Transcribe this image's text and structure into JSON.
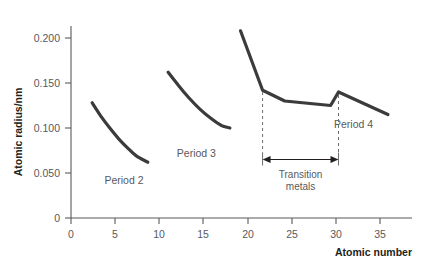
{
  "chart_data": {
    "type": "line",
    "title": "",
    "xlabel": "Atomic number",
    "ylabel": "Atomic radius/nm",
    "xlim": [
      0,
      38
    ],
    "ylim": [
      0,
      0.215
    ],
    "grid": false,
    "legend_position": "inline-labels",
    "x_ticks": [
      "0",
      "5",
      "10",
      "15",
      "20",
      "25",
      "30",
      "35"
    ],
    "x_tick_values": [
      0,
      5,
      10,
      15,
      20,
      25,
      30,
      35
    ],
    "y_ticks": [
      "0",
      "0.050",
      "0.100",
      "0.150",
      "0.200"
    ],
    "y_tick_values": [
      0,
      0.05,
      0.1,
      0.15,
      0.2
    ],
    "series": [
      {
        "name": "Period 2",
        "label": "Period 2",
        "label_x": 6.0,
        "label_y": 0.038,
        "curve": "smooth",
        "x": [
          2.4,
          3.4,
          4.4,
          5.4,
          6.4,
          7.4,
          8.7
        ],
        "values": [
          0.128,
          0.113,
          0.1,
          0.088,
          0.078,
          0.069,
          0.062
        ]
      },
      {
        "name": "Period 3",
        "label": "Period 3",
        "label_x": 14.2,
        "label_y": 0.068,
        "curve": "smooth",
        "x": [
          11.0,
          12.2,
          13.4,
          14.6,
          15.8,
          17.0,
          18.0
        ],
        "values": [
          0.162,
          0.147,
          0.133,
          0.121,
          0.111,
          0.103,
          0.1
        ]
      },
      {
        "name": "Period 4",
        "label": "Period 4",
        "label_x": 32.0,
        "label_y": 0.1,
        "curve": "linear",
        "x": [
          19.2,
          21.7,
          24.2,
          29.4,
          30.3,
          35.9
        ],
        "values": [
          0.208,
          0.142,
          0.13,
          0.125,
          0.14,
          0.115
        ]
      }
    ],
    "annotations": [
      {
        "name": "transition-metals-span",
        "text_line1": "Transition",
        "text_line2": "metals",
        "x_start": 21.7,
        "x_end": 30.3,
        "y_arrow": 0.065,
        "style": "double-headed-arrow-with-dashed-guides"
      }
    ],
    "colors": {
      "curve": "#3b3b3d",
      "axis": "#58595b",
      "text": "#58595b",
      "annotation": "#231f20",
      "background": "#ffffff"
    }
  }
}
